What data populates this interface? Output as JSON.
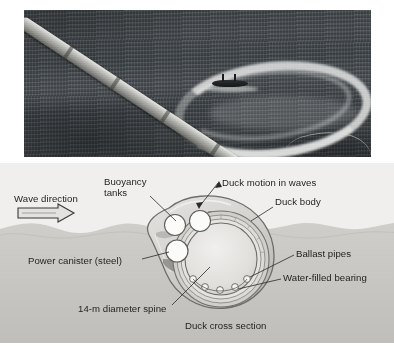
{
  "figure": {
    "caption_labels": {
      "wave_direction": "Wave direction",
      "buoyancy_tanks": "Buoyancy tanks",
      "duck_motion": "Duck motion in waves",
      "duck_body": "Duck body",
      "power_canister": "Power canister (steel)",
      "ballast_pipes": "Ballast pipes",
      "water_filled_bearing": "Water-filled bearing",
      "spine": "14-m diameter spine",
      "duck_cross_section": "Duck cross section"
    },
    "colors": {
      "diagram_background": "#f0efee",
      "sea_fill": "#c9c8c6",
      "sky_fill": "#ececea",
      "duck_body_fill": "#d8d7d5",
      "duck_body_stroke": "#6d6b68",
      "spine_ring_fill": "#e3e2e0",
      "tank_fill": "#fbfbfa",
      "web_dark": "#8e8c88",
      "label_text": "#201e1d",
      "photo_sea": "#43484b",
      "photo_foam": "#ecedeb",
      "photo_spine": "#b6b7b2"
    },
    "photo": {
      "alt_name": "aerial-photo-of-duck-spine-at-sea",
      "elements": [
        "floating-spine-tube",
        "foam-wake-arc",
        "support-boat",
        "tow-cable",
        "open-sea"
      ]
    },
    "ghost_text": "the bed of the ocean so that it can be anchored and the power can be routed to the onshore grid. The prototype device shown in the photograph was tested off the coast of Scotland and was found to produce useful amounts of electrical power. Wave energy remains an attractive renewable resource for many coastal regions.",
    "geometry": {
      "ballast_pipe_count": 5,
      "buoyancy_tank_count": 2,
      "power_canister_count": 1,
      "spine_ring_count": 4
    }
  }
}
